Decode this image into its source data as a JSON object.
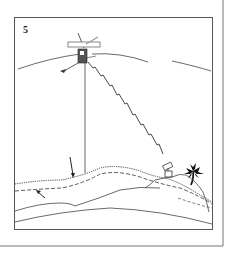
{
  "figure": {
    "panel_number": "5",
    "elements": [
      {
        "name": "satellite",
        "description": "satellite with solar panels"
      },
      {
        "name": "nadir-line",
        "description": "vertical line from satellite to sea surface"
      },
      {
        "name": "signal-link",
        "description": "zigzag signal path to ground station"
      },
      {
        "name": "ground-station",
        "description": "tracking station on island"
      },
      {
        "name": "palm-tree",
        "description": "palm tree on island"
      },
      {
        "name": "sea-surface",
        "description": "dotted sea surface"
      },
      {
        "name": "geoid",
        "description": "dashed geoid line"
      },
      {
        "name": "arrows",
        "description": "two arrows pointing to surface and geoid"
      }
    ],
    "colors": {
      "line": "#333333",
      "frame": "#666666",
      "background": "#ffffff"
    }
  }
}
